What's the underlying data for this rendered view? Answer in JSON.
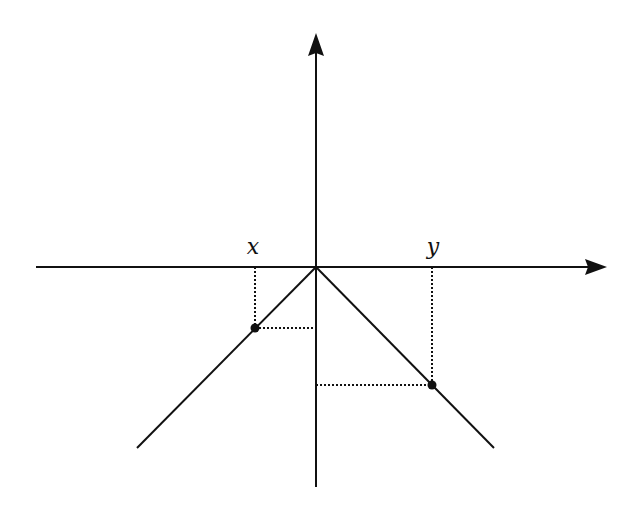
{
  "diagram": {
    "colors": {
      "stroke": "#111111",
      "background": "#ffffff"
    },
    "axes": {
      "origin": [
        316,
        267
      ],
      "x_axis": {
        "from": [
          36,
          267
        ],
        "to": [
          607,
          267
        ],
        "arrow": true
      },
      "y_axis": {
        "from": [
          316,
          487
        ],
        "to": [
          316,
          33
        ],
        "arrow": true
      }
    },
    "curve": {
      "name": "V-shaped graph (inverted)",
      "left_branch": {
        "from": [
          316,
          267
        ],
        "to": [
          137,
          448
        ]
      },
      "right_branch": {
        "from": [
          316,
          267
        ],
        "to": [
          494,
          448
        ]
      }
    },
    "points": [
      {
        "label": "x",
        "on_axis": [
          255,
          267
        ],
        "on_curve": [
          255,
          328
        ],
        "on_y_axis": [
          316,
          328
        ],
        "label_pos": [
          253,
          254
        ]
      },
      {
        "label": "y",
        "on_axis": [
          432,
          267
        ],
        "on_curve": [
          432,
          385
        ],
        "on_y_axis": [
          316,
          385
        ],
        "label_pos": [
          433,
          254
        ]
      }
    ]
  }
}
